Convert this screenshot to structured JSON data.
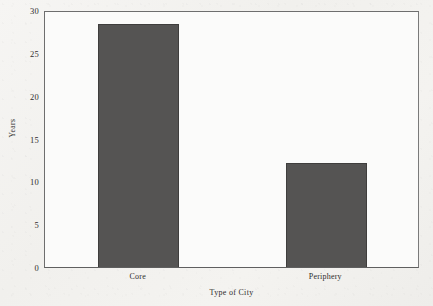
{
  "chart_data": {
    "type": "bar",
    "title": "",
    "subtitle": "",
    "xlabel": "Type of City",
    "ylabel": "Years",
    "categories": [
      "Core",
      "Periphery"
    ],
    "values": [
      28.4,
      12.2
    ],
    "series": [
      {
        "name": "Years",
        "values": [
          28.4,
          12.2
        ]
      }
    ],
    "ylim": [
      0,
      30
    ],
    "yticks": [
      0,
      5,
      10,
      15,
      20,
      25,
      30
    ],
    "ytick_labels": [
      "0",
      "5",
      "10",
      "15",
      "20",
      "25",
      "30"
    ],
    "grid": false,
    "legend": false,
    "legend_position": "none",
    "bar_color": "#555453",
    "bar_edge_color": "#3f3e3d",
    "plot_background": "#fbfbfa",
    "figure_background": "#f3f2ef",
    "axis_color": "#6e6e6e",
    "text_color": "#2e2d2c"
  }
}
